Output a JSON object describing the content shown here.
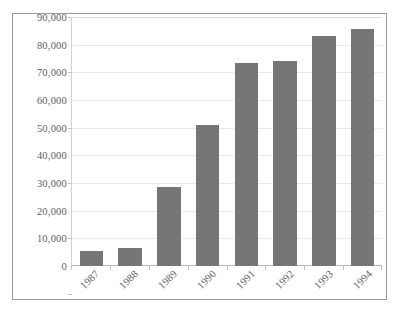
{
  "chart_data": {
    "type": "bar",
    "title": "",
    "subtitle": "",
    "xlabel": "",
    "ylabel": "",
    "categories": [
      "1987",
      "1988",
      "1989",
      "1990",
      "1991",
      "1992",
      "1993",
      "1994"
    ],
    "values": [
      5300,
      6400,
      28500,
      51000,
      73500,
      74200,
      83200,
      85800
    ],
    "ylim": [
      0,
      90000
    ],
    "ytick_values": [
      0,
      10000,
      20000,
      30000,
      40000,
      50000,
      60000,
      70000,
      80000,
      90000
    ],
    "ytick_labels": [
      "0",
      "10,000",
      "20,000",
      "30,000",
      "40,000",
      "50,000",
      "60,000",
      "70,000",
      "80,000",
      "90,000"
    ],
    "grid": true,
    "grid_axis": "y",
    "legend": false,
    "legend_position": "none",
    "xtick_rotation": -45,
    "series": [
      {
        "name": "",
        "values": [
          5300,
          6400,
          28500,
          51000,
          73500,
          74200,
          83200,
          85800
        ]
      }
    ],
    "colors": {
      "bar_fill": "#767676",
      "gridline": "#e9e9e9",
      "axis_line": "#b8b8b8",
      "tick_label": "#5d5d5d",
      "frame_border": "#9a9a9a",
      "plot_background": "#ffffff"
    }
  }
}
